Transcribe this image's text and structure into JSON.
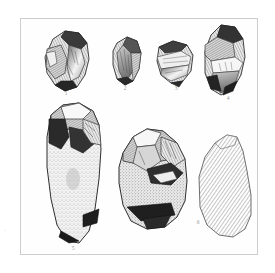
{
  "page": {
    "running_head": "——— ———— —— ————",
    "background_color": "#ffffff",
    "frame_color": "#cdcdcd"
  },
  "plate": {
    "caption": "",
    "figures": [
      {
        "id": "figure-1",
        "label": "1",
        "description": "flint core with flake scars, dark shading upper left, bright conchoidal face right",
        "row": "top",
        "position": 1
      },
      {
        "id": "figure-2",
        "label": "2",
        "description": "narrow elongated flake, ridged dorsal face, pointed base",
        "row": "top",
        "position": 2
      },
      {
        "id": "figure-3",
        "label": "3",
        "description": "small squat core fragment, banded horizontal flake scars",
        "row": "top",
        "position": 3
      },
      {
        "id": "figure-4",
        "label": "4",
        "description": "tall tapering core, dark cortex top and bottom, pale flake scar centre",
        "row": "top",
        "position": 4
      },
      {
        "id": "figure-5",
        "label": "5",
        "description": "large elongated handaxe, worked upper end with deep flake scars, stippled lower shaft, dark base",
        "row": "bottom",
        "position": 1
      },
      {
        "id": "figure-middle",
        "label": "",
        "description": "large core, heavily worked top with overlapping flake scars, stippled lower body, dark basal edge",
        "row": "bottom",
        "position": 2
      },
      {
        "id": "figure-6",
        "label": "6",
        "description": "outline flake section rendered entirely in diagonal line hatching, no shading",
        "row": "bottom",
        "position": 3
      }
    ],
    "margin_mark": "·"
  },
  "render": {
    "stone_dark": "#2b2b2b",
    "stone_mid": "#7a7a7a",
    "stone_light": "#d8d8d8",
    "outline": "#333333",
    "hatch_color": "#8c8c8c"
  }
}
